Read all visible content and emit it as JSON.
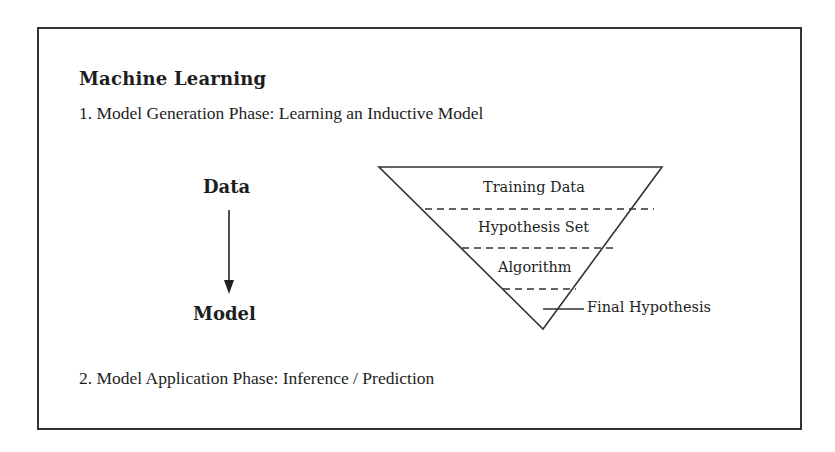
{
  "figure": {
    "title": "Machine Learning",
    "phase1": "1. Model Generation Phase: Learning an Inductive Model",
    "phase2": "2. Model Application Phase: Inference / Prediction",
    "flow": {
      "from": "Data",
      "to": "Model",
      "arrow": "down-arrow"
    },
    "funnel": {
      "layers": [
        "Training Data",
        "Hypothesis Set",
        "Algorithm"
      ],
      "apex_label": "Final Hypothesis"
    }
  }
}
